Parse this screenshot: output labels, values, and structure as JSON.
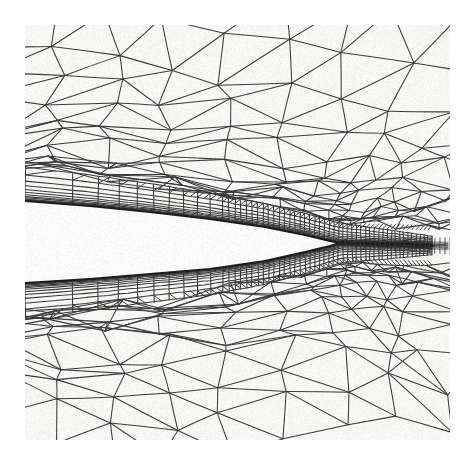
{
  "figure": {
    "kind": "mesh-plot",
    "title": "Unstructured hybrid mesh near airfoil trailing edge",
    "caption": "",
    "width": 460,
    "height": 470
  },
  "canvas": {
    "background_color": "#ffffff",
    "plot_background_color": "#f7f7f5",
    "line_color": "#3a3a3a",
    "wall_color": "#202020",
    "body_fill_color": "#fbfbfb",
    "margins": {
      "left": 25,
      "top": 25,
      "right": 10,
      "bottom": 30
    },
    "plot_rect": {
      "x": 25,
      "y": 25,
      "width": 425,
      "height": 415
    }
  },
  "chart_data": {
    "type": "mesh",
    "title": "Unstructured hybrid mesh near airfoil trailing edge",
    "xlabel": "",
    "ylabel": "",
    "grid": false,
    "legend": null,
    "xlim": [
      25,
      450
    ],
    "ylim": [
      25,
      440
    ],
    "body": {
      "name": "airfoil-trailing-edge-wedge",
      "description": "solid wedge, blank interior, sharp trailing edge tip",
      "tip": {
        "x": 340,
        "y": 243
      },
      "upper_surface": [
        {
          "x": 25,
          "y": 201
        },
        {
          "x": 90,
          "y": 206
        },
        {
          "x": 150,
          "y": 212
        },
        {
          "x": 210,
          "y": 219
        },
        {
          "x": 265,
          "y": 227
        },
        {
          "x": 305,
          "y": 235
        },
        {
          "x": 330,
          "y": 241
        },
        {
          "x": 340,
          "y": 243
        }
      ],
      "lower_surface": [
        {
          "x": 25,
          "y": 283
        },
        {
          "x": 90,
          "y": 279
        },
        {
          "x": 150,
          "y": 274
        },
        {
          "x": 210,
          "y": 269
        },
        {
          "x": 265,
          "y": 261
        },
        {
          "x": 305,
          "y": 252
        },
        {
          "x": 330,
          "y": 246
        },
        {
          "x": 340,
          "y": 243
        }
      ],
      "thickness_at_left": 82,
      "thickness_at_tip": 0
    },
    "wake": {
      "name": "wake-line",
      "start": {
        "x": 340,
        "y": 243
      },
      "end": {
        "x": 450,
        "y": 246
      },
      "band_half_thickness": 3,
      "refined": true
    },
    "boundary_layer": {
      "name": "structured-prism-layers",
      "upper_layer_count": 12,
      "lower_layer_count": 12,
      "first_cell_height": 0.8,
      "growth_ratio": 1.28,
      "total_thickness_left": 34,
      "total_thickness_te": 20,
      "streamwise_divisions_left": 14,
      "streamwise_divisions_te": 52
    },
    "far_field_mesh": {
      "name": "unstructured-triangles",
      "type": "delaunay-triangulation",
      "coarse_edge_length": 62,
      "fine_edge_length": 7,
      "refinement_focus": {
        "x": 340,
        "y": 243
      },
      "refinement_radius": 150,
      "upper_region_rows": 9,
      "lower_region_rows": 9
    },
    "style": {
      "line_width": 1.05,
      "line_color": "#3a3a3a",
      "wall_line_width": 2.2,
      "wall_line_color": "#1c1c1c",
      "antialias": true,
      "scan_noise": true
    }
  },
  "annotations": {
    "tip_label": "",
    "axis_ticks": [],
    "colorbar": null
  }
}
